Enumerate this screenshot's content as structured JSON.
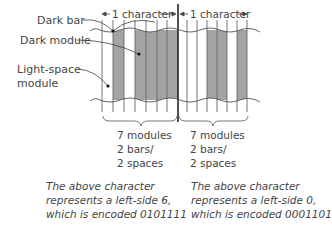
{
  "labels": {
    "dark_bar": "Dark bar",
    "dark_module": "Dark module",
    "light_space_1": "Light-space",
    "light_space_2": "module",
    "char1_span": "1 character",
    "char2_span": "1 character"
  },
  "characters": [
    {
      "modules_line1": "7 modules",
      "modules_line2": "2 bars/",
      "modules_line3": "2 spaces",
      "desc_line1": "The above character",
      "desc_line2": "represents a left-side 6,",
      "desc_line3": "which is encoded 0101111",
      "encoding": "0101111"
    },
    {
      "modules_line1": "7 modules",
      "modules_line2": "2 bars/",
      "modules_line3": "2 spaces",
      "desc_line1": "The above character",
      "desc_line2": "represents a left-side 0,",
      "desc_line3": "which is encoded 0001101",
      "encoding": "0001101"
    }
  ],
  "colors": {
    "dark_module": "#a3a3a3",
    "line": "#555555"
  }
}
